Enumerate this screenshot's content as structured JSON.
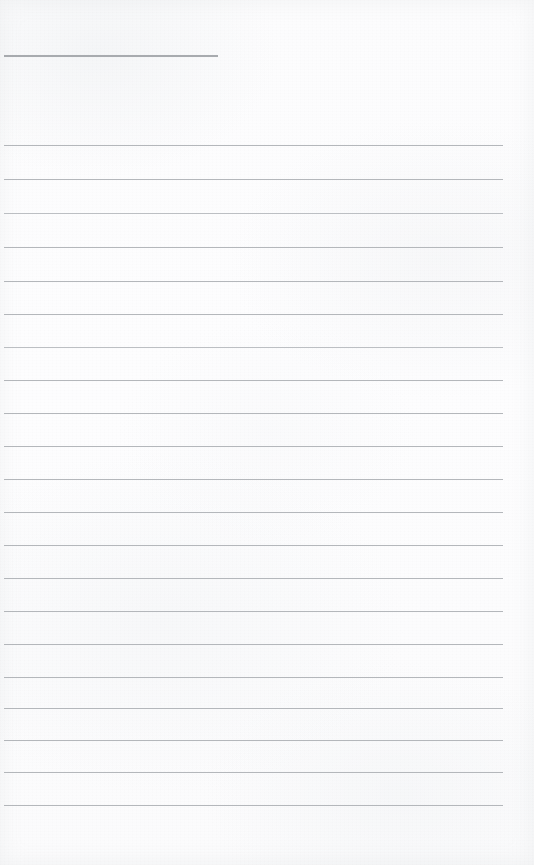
{
  "document": {
    "kind": "scanned-lined-paper",
    "description": "Blank ruled notebook page scan",
    "visible_text": "",
    "page_width": 534,
    "page_height": 865
  },
  "colors": {
    "paper": "#fdfdfd",
    "rule_line": "#b4b7bb",
    "heading_rule": "#a8abaf",
    "rule_line_faint": "#bcbfc3"
  },
  "layout": {
    "rule_left_x": 4,
    "rule_right_x": 503,
    "heading_rule_right_x": 218
  },
  "rules": [
    {
      "name": "heading-rule",
      "y": 55,
      "x1": 4,
      "x2": 218,
      "weight": "heading"
    },
    {
      "name": "rule-line-01",
      "y": 145,
      "x1": 4,
      "x2": 503,
      "weight": "normal"
    },
    {
      "name": "rule-line-02",
      "y": 179,
      "x1": 4,
      "x2": 503,
      "weight": "normal"
    },
    {
      "name": "rule-line-03",
      "y": 213,
      "x1": 4,
      "x2": 503,
      "weight": "faint"
    },
    {
      "name": "rule-line-04",
      "y": 247,
      "x1": 4,
      "x2": 503,
      "weight": "normal"
    },
    {
      "name": "rule-line-05",
      "y": 281,
      "x1": 4,
      "x2": 503,
      "weight": "normal"
    },
    {
      "name": "rule-line-06",
      "y": 314,
      "x1": 4,
      "x2": 503,
      "weight": "normal"
    },
    {
      "name": "rule-line-07",
      "y": 347,
      "x1": 4,
      "x2": 503,
      "weight": "faint"
    },
    {
      "name": "rule-line-08",
      "y": 380,
      "x1": 4,
      "x2": 503,
      "weight": "normal"
    },
    {
      "name": "rule-line-09",
      "y": 413,
      "x1": 4,
      "x2": 503,
      "weight": "normal"
    },
    {
      "name": "rule-line-10",
      "y": 446,
      "x1": 4,
      "x2": 503,
      "weight": "normal"
    },
    {
      "name": "rule-line-11",
      "y": 479,
      "x1": 4,
      "x2": 503,
      "weight": "normal"
    },
    {
      "name": "rule-line-12",
      "y": 512,
      "x1": 4,
      "x2": 503,
      "weight": "normal"
    },
    {
      "name": "rule-line-13",
      "y": 545,
      "x1": 4,
      "x2": 503,
      "weight": "normal"
    },
    {
      "name": "rule-line-14",
      "y": 578,
      "x1": 4,
      "x2": 503,
      "weight": "normal"
    },
    {
      "name": "rule-line-15",
      "y": 611,
      "x1": 4,
      "x2": 503,
      "weight": "normal"
    },
    {
      "name": "rule-line-16",
      "y": 644,
      "x1": 4,
      "x2": 503,
      "weight": "normal"
    },
    {
      "name": "rule-line-17",
      "y": 677,
      "x1": 4,
      "x2": 503,
      "weight": "normal"
    },
    {
      "name": "rule-line-18",
      "y": 708,
      "x1": 4,
      "x2": 503,
      "weight": "normal"
    },
    {
      "name": "rule-line-19",
      "y": 740,
      "x1": 4,
      "x2": 503,
      "weight": "normal"
    },
    {
      "name": "rule-line-20",
      "y": 772,
      "x1": 4,
      "x2": 503,
      "weight": "normal"
    },
    {
      "name": "rule-line-21",
      "y": 805,
      "x1": 4,
      "x2": 503,
      "weight": "normal"
    }
  ]
}
